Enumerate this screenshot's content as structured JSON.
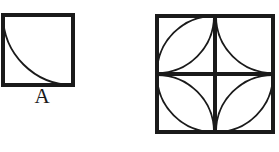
{
  "figure": {
    "type": "geometry-diagram",
    "title": "",
    "background_color": "#ffffff",
    "stroke_color": "#1a1a1a",
    "border_stroke_width": 4,
    "arc_stroke_width": 1.6,
    "panels": [
      {
        "id": "panel-a",
        "label": "A",
        "label_position": "below",
        "x": 2,
        "y": 14,
        "size": 72,
        "description": "Square tile containing one quarter-circle arc from the top-left corner to the bottom-right corner, centred on the top-right corner, bulging toward the bottom-left.",
        "arcs": [
          {
            "name": "arc-main",
            "from": "top-left",
            "to": "bottom-right",
            "center": "top-right",
            "sweep": "concave-down-left"
          }
        ]
      },
      {
        "id": "panel-b",
        "label": "",
        "label_position": "none",
        "x": 156,
        "y": 14,
        "size": 118,
        "description": "Large square divided into a two-by-two grid of four equal sub-squares, each holding quarter-circle arcs in different orientations.",
        "grid": {
          "rows": 2,
          "cols": 2
        },
        "cells": [
          {
            "name": "cell-top-left",
            "row": 0,
            "col": 0,
            "arc_count": 2,
            "arcs": [
              {
                "name": "arc-1",
                "center": "bottom-right",
                "from": "top-right",
                "to": "bottom-left"
              },
              {
                "name": "arc-2",
                "center": "top-left",
                "from": "top-right",
                "to": "bottom-left"
              }
            ]
          },
          {
            "name": "cell-top-right",
            "row": 0,
            "col": 1,
            "arc_count": 1,
            "arcs": [
              {
                "name": "arc-1",
                "center": "top-right",
                "from": "top-left",
                "to": "bottom-right"
              }
            ]
          },
          {
            "name": "cell-bottom-left",
            "row": 1,
            "col": 0,
            "arc_count": 2,
            "arcs": [
              {
                "name": "arc-1",
                "center": "bottom-left",
                "from": "top-left",
                "to": "bottom-right"
              },
              {
                "name": "arc-2",
                "center": "top-right",
                "from": "top-left",
                "to": "bottom-right"
              }
            ]
          },
          {
            "name": "cell-bottom-right",
            "row": 1,
            "col": 1,
            "arc_count": 2,
            "arcs": [
              {
                "name": "arc-1",
                "center": "top-left",
                "from": "top-right",
                "to": "bottom-left"
              },
              {
                "name": "arc-2",
                "center": "bottom-right",
                "from": "top-right",
                "to": "bottom-left"
              }
            ]
          }
        ]
      }
    ]
  }
}
